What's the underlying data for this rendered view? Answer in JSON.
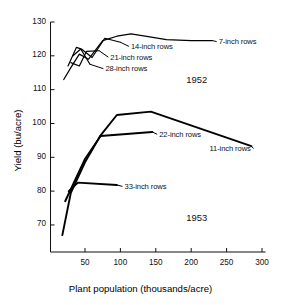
{
  "chart_data": {
    "type": "line",
    "title": "",
    "xlabel": "Plant population (thousands/acre)",
    "ylabel": "Yield (bu/acre)",
    "xlim": [
      0,
      300
    ],
    "ylim": [
      62,
      130
    ],
    "xticks": [
      50,
      100,
      150,
      200,
      250,
      300
    ],
    "yticks": [
      70,
      80,
      90,
      100,
      110,
      120,
      130
    ],
    "grid": false,
    "legend_position": "inline-annotations",
    "annotations": [
      {
        "text": "1952",
        "x": 193,
        "y": 113
      },
      {
        "text": "1953",
        "x": 193,
        "y": 72
      }
    ],
    "series": [
      {
        "name": "7-inch rows",
        "year": 1952,
        "label": "7-inch rows",
        "x": [
          20,
          30,
          42,
          55,
          75,
          95,
          115,
          135,
          165,
          200,
          230
        ],
        "y": [
          113.0,
          116.5,
          120.5,
          119.0,
          124.5,
          125.8,
          126.5,
          125.8,
          124.8,
          124.5,
          124.5
        ]
      },
      {
        "name": "14-inch rows",
        "year": 1952,
        "label": "14-inch rows",
        "x": [
          26,
          38,
          45,
          60,
          78,
          100
        ],
        "y": [
          117.0,
          122.5,
          122.0,
          119.5,
          125.2,
          124.0
        ]
      },
      {
        "name": "21-inch rows",
        "year": 1952,
        "label": "21-inch rows",
        "x": [
          30,
          42,
          52,
          70
        ],
        "y": [
          118.0,
          117.0,
          121.3,
          121.5
        ]
      },
      {
        "name": "28-inch rows",
        "year": 1952,
        "label": "28-inch rows",
        "x": [
          33,
          44,
          57
        ],
        "y": [
          120.0,
          122.0,
          117.5
        ]
      },
      {
        "name": "11-inch rows",
        "year": 1953,
        "label": "11-inch rows",
        "x": [
          18,
          30,
          50,
          72,
          95,
          143,
          285
        ],
        "y": [
          67.0,
          79.5,
          88.5,
          96.5,
          102.5,
          103.5,
          93.3
        ]
      },
      {
        "name": "22-inch rows",
        "year": 1953,
        "label": "22-inch rows",
        "x": [
          22,
          50,
          72,
          145
        ],
        "y": [
          77.0,
          89.5,
          96.3,
          97.5
        ]
      },
      {
        "name": "33-inch rows",
        "year": 1953,
        "label": "33-inch rows",
        "x": [
          27,
          40,
          95
        ],
        "y": [
          80.0,
          82.5,
          81.8
        ]
      }
    ],
    "leaders": [
      {
        "series": "7-inch rows",
        "from_x": 230,
        "from_y": 124.5,
        "to_x": 236,
        "to_y": 124.2
      },
      {
        "series": "14-inch rows",
        "from_x": 100,
        "from_y": 124.0,
        "to_x": 112,
        "to_y": 122.8
      },
      {
        "series": "21-inch rows",
        "from_x": 70,
        "from_y": 121.5,
        "to_x": 83,
        "to_y": 119.6
      },
      {
        "series": "28-inch rows",
        "from_x": 57,
        "from_y": 117.5,
        "to_x": 76,
        "to_y": 116.2
      },
      {
        "series": "22-inch rows",
        "from_x": 145,
        "from_y": 97.5,
        "to_x": 152,
        "to_y": 96.8
      },
      {
        "series": "11-inch rows",
        "from_x": 285,
        "from_y": 93.3,
        "to_x": 288,
        "to_y": 92.6
      },
      {
        "series": "33-inch rows",
        "from_x": 95,
        "from_y": 81.8,
        "to_x": 103,
        "to_y": 81.4
      }
    ]
  },
  "axis": {
    "xtick_labels": [
      "50",
      "100",
      "150",
      "200",
      "250",
      "300"
    ],
    "ytick_labels": [
      "70",
      "80",
      "90",
      "100",
      "110",
      "120",
      "130"
    ],
    "xlabel": "Plant population (thousands/acre)",
    "ylabel": "Yield (bu/acre)"
  },
  "labels": {
    "s7": "7-inch rows",
    "s14": "14-inch rows",
    "s21": "21-inch rows",
    "s28": "28-inch rows",
    "s11": "11-inch rows",
    "s22": "22-inch rows",
    "s33": "33-inch rows",
    "year1952": "1952",
    "year1953": "1953"
  },
  "colors": {
    "line": "#000000",
    "axis": "#111111",
    "background": "#ffffff"
  }
}
